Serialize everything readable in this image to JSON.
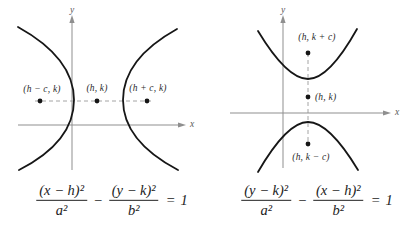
{
  "figure": {
    "colors": {
      "curve": "#161616",
      "axis": "#8f8f8f",
      "dashed_line": "#9a9a9a",
      "label_text": "#2b2b2b",
      "equation_text": "#222222",
      "background": "#ffffff"
    },
    "left_diagram": {
      "type": "hyperbola-horizontal-transverse-axis",
      "y_axis_label": "y",
      "x_axis_label": "x",
      "point_labels": {
        "left_focus": "(h − c, k)",
        "center": "(h, k)",
        "right_focus": "(h + c, k)"
      },
      "equation": {
        "numerator_1": "(x − h)²",
        "denominator_1": "a²",
        "operator": "−",
        "numerator_2": "(y − k)²",
        "denominator_2": "b²",
        "equals": "=",
        "rhs": "1"
      }
    },
    "right_diagram": {
      "type": "hyperbola-vertical-transverse-axis",
      "y_axis_label": "y",
      "x_axis_label": "x",
      "point_labels": {
        "top_focus": "(h, k + c)",
        "center": "(h, k)",
        "bottom_focus": "(h, k − c)"
      },
      "equation": {
        "numerator_1": "(y − k)²",
        "denominator_1": "a²",
        "operator": "−",
        "numerator_2": "(x − h)²",
        "denominator_2": "b²",
        "equals": "=",
        "rhs": "1"
      }
    }
  }
}
